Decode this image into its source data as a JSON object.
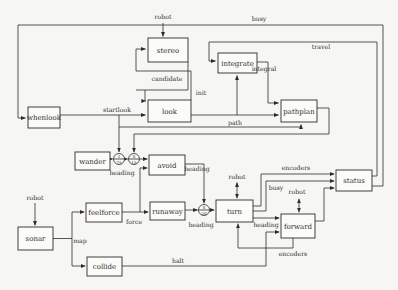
{
  "nodes": {
    "whenlook": "whenlook",
    "stereo": "stereo",
    "look": "look",
    "integrate": "integrate",
    "pathplan": "pathplan",
    "wander": "wander",
    "avoid": "avoid",
    "feelforce": "feelforce",
    "runaway": "runaway",
    "sonar": "sonar",
    "collide": "collide",
    "turn": "turn",
    "forward": "forward",
    "status": "status"
  },
  "edge_labels": {
    "robot_stereo": "robot",
    "busy_top": "busy",
    "travel": "travel",
    "candidate": "candidate",
    "init": "init",
    "integral": "integral",
    "startlook": "startlook",
    "path": "path",
    "heading_wander": "heading",
    "heading_avoid": "heading",
    "heading_runaway": "heading",
    "heading_turn": "heading",
    "force": "force",
    "map": "map",
    "halt": "halt",
    "robot_sonar": "robot",
    "robot_turn": "robot",
    "robot_forward": "robot",
    "busy_turn": "busy",
    "encoders_top": "encoders",
    "encoders_bottom": "encoders"
  },
  "connectors": {
    "inhibit_wander": {
      "letter": "I",
      "time": "75"
    },
    "suppress_avoid": {
      "letter": "S",
      "time": "15"
    },
    "suppress_turn": {
      "letter": "S",
      "time": "20"
    }
  },
  "colors": {
    "background": "#f6f7f4",
    "line": "#2e2c29",
    "text": "#33302b"
  }
}
